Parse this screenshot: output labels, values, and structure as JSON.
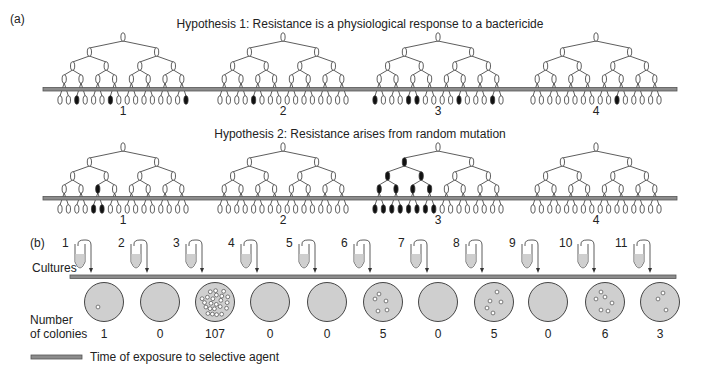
{
  "panel_a": {
    "label": "(a)",
    "hypotheses": [
      {
        "title": "Hypothesis 1: Resistance is a physiological response to a bactericide",
        "trees": [
          {
            "label": "1",
            "root_x": 123,
            "black_leaves": [
              2,
              6,
              15
            ],
            "black_internal": []
          },
          {
            "label": "2",
            "root_x": 283,
            "black_leaves": [
              4
            ],
            "black_internal": []
          },
          {
            "label": "3",
            "root_x": 438,
            "black_leaves": [
              0,
              4,
              5,
              10,
              14
            ],
            "black_internal": []
          },
          {
            "label": "4",
            "root_x": 596,
            "black_leaves": [
              10
            ],
            "black_internal": []
          }
        ]
      },
      {
        "title": "Hypothesis 2: Resistance arises from random mutation",
        "trees": [
          {
            "label": "1",
            "root_x": 123,
            "black_leaves": [
              4,
              5
            ],
            "black_internal": [
              [
                3,
                2
              ]
            ]
          },
          {
            "label": "2",
            "root_x": 283,
            "black_leaves": [],
            "black_internal": []
          },
          {
            "label": "3",
            "root_x": 438,
            "black_leaves": [
              0,
              1,
              2,
              3,
              4,
              5,
              6,
              7
            ],
            "black_internal": [
              [
                1,
                0
              ],
              [
                2,
                0
              ],
              [
                2,
                1
              ],
              [
                3,
                0
              ],
              [
                3,
                1
              ],
              [
                3,
                2
              ],
              [
                3,
                3
              ]
            ]
          },
          {
            "label": "4",
            "root_x": 596,
            "black_leaves": [],
            "black_internal": []
          }
        ]
      }
    ]
  },
  "panel_b": {
    "label": "(b)",
    "row_label_cultures": "Cultures",
    "row_label_colonies_line1": "Number",
    "row_label_colonies_line2": "of colonies",
    "cultures": [
      {
        "label": "1",
        "colonies": "1"
      },
      {
        "label": "2",
        "colonies": "0"
      },
      {
        "label": "3",
        "colonies": "107"
      },
      {
        "label": "4",
        "colonies": "0"
      },
      {
        "label": "5",
        "colonies": "0"
      },
      {
        "label": "6",
        "colonies": "5"
      },
      {
        "label": "7",
        "colonies": "0"
      },
      {
        "label": "8",
        "colonies": "5"
      },
      {
        "label": "9",
        "colonies": "0"
      },
      {
        "label": "10",
        "colonies": "6"
      },
      {
        "label": "11",
        "colonies": "3"
      }
    ]
  },
  "legend": {
    "label": "Time of exposure to selective agent"
  },
  "colors": {
    "bar_fill": "#8c8c8c",
    "bar_edge": "#555555",
    "plate_fill": "#cfcfcf",
    "mutant_fill": "#111111",
    "line": "#333333"
  }
}
